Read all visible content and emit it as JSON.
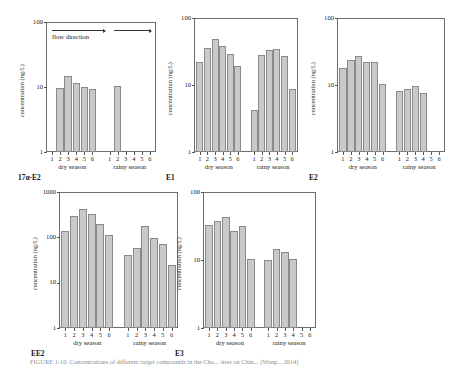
{
  "figure": {
    "caption": "FIGURE 1-10. Concentrations of different target compounds in the Cho... sites on Chin... (Wang... 2014)",
    "flow": {
      "label": "flow direction"
    },
    "axis": {
      "ylabel": "concentration (ng/L)"
    },
    "seasons": {
      "dry": "dry season",
      "rainy": "rainy season"
    },
    "site_numbers": [
      "1",
      "2",
      "3",
      "4",
      "5",
      "6"
    ]
  },
  "chart_data": [
    {
      "type": "bar",
      "panel": "17α-E2",
      "title": "17α-E2",
      "xlabel": "",
      "ylabel": "concentration (ng/L)",
      "yscale": "log",
      "ylim": [
        1,
        100
      ],
      "yticks": [
        1,
        10,
        100
      ],
      "ytick_labels": [
        "1",
        "10",
        "100"
      ],
      "grid": false,
      "categories": [
        "1",
        "2",
        "3",
        "4",
        "5",
        "6"
      ],
      "series": [
        {
          "name": "dry season",
          "values": [
            null,
            9.8,
            15.0,
            11.6,
            10.0,
            9.2
          ]
        },
        {
          "name": "rainy season",
          "values": [
            null,
            10.5,
            null,
            null,
            null,
            null
          ]
        }
      ],
      "annotations": [
        "flow direction"
      ]
    },
    {
      "type": "bar",
      "panel": "E1",
      "title": "E1",
      "xlabel": "",
      "ylabel": "concentration (ng/L)",
      "yscale": "log",
      "ylim": [
        1,
        100
      ],
      "yticks": [
        1,
        10,
        100
      ],
      "ytick_labels": [
        "1",
        "10",
        "100"
      ],
      "grid": false,
      "categories": [
        "1",
        "2",
        "3",
        "4",
        "5",
        "6"
      ],
      "series": [
        {
          "name": "dry season",
          "values": [
            22.0,
            36.0,
            48.0,
            38.0,
            29.0,
            19.0
          ]
        },
        {
          "name": "rainy season",
          "values": [
            4.3,
            28.0,
            33.0,
            34.0,
            27.0,
            8.6
          ]
        }
      ],
      "annotations": []
    },
    {
      "type": "bar",
      "panel": "E2",
      "title": "E2",
      "xlabel": "",
      "ylabel": "concentration (ng/L)",
      "yscale": "log",
      "ylim": [
        1,
        100
      ],
      "yticks": [
        1,
        10,
        100
      ],
      "ytick_labels": [
        "1",
        "10",
        "100"
      ],
      "grid": false,
      "categories": [
        "1",
        "2",
        "3",
        "4",
        "5",
        "6"
      ],
      "series": [
        {
          "name": "dry season",
          "values": [
            18.0,
            24.0,
            27.0,
            22.0,
            22.0,
            10.5
          ]
        },
        {
          "name": "rainy season",
          "values": [
            8.0,
            8.8,
            9.7,
            7.5,
            null,
            null
          ]
        }
      ],
      "annotations": []
    },
    {
      "type": "bar",
      "panel": "EE2",
      "title": "EE2",
      "xlabel": "",
      "ylabel": "concentration (ng/L)",
      "yscale": "log",
      "ylim": [
        1,
        1000
      ],
      "yticks": [
        1,
        10,
        100,
        1000
      ],
      "ytick_labels": [
        "1",
        "10",
        "100",
        "1000"
      ],
      "grid": false,
      "categories": [
        "1",
        "2",
        "3",
        "4",
        "5",
        "6"
      ],
      "series": [
        {
          "name": "dry season",
          "values": [
            140.0,
            300.0,
            430.0,
            330.0,
            200.0,
            110.0
          ]
        },
        {
          "name": "rainy season",
          "values": [
            40.0,
            58.0,
            180.0,
            95.0,
            70.0,
            25.0
          ]
        }
      ],
      "annotations": []
    },
    {
      "type": "bar",
      "panel": "E3",
      "title": "E3",
      "xlabel": "",
      "ylabel": "concentration (ng/L)",
      "yscale": "log",
      "ylim": [
        1,
        100
      ],
      "yticks": [
        1,
        10,
        100
      ],
      "ytick_labels": [
        "1",
        "10",
        "100"
      ],
      "grid": false,
      "categories": [
        "1",
        "2",
        "3",
        "4",
        "5",
        "6"
      ],
      "series": [
        {
          "name": "dry season",
          "values": [
            33.0,
            37.0,
            43.0,
            27.0,
            32.0,
            10.2
          ]
        },
        {
          "name": "rainy season",
          "values": [
            10.0,
            14.5,
            13.0,
            10.2,
            null,
            null
          ]
        }
      ],
      "annotations": []
    }
  ]
}
